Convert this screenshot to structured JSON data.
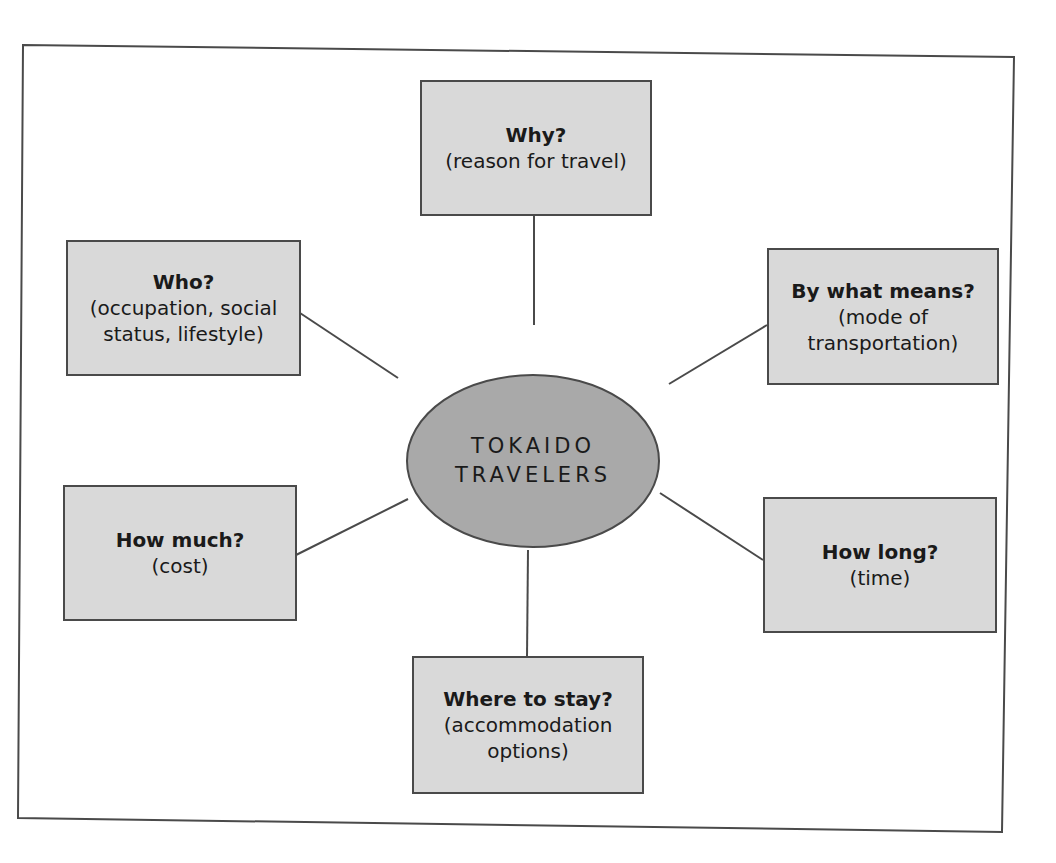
{
  "diagram": {
    "type": "mind-map",
    "center": {
      "line1": "TOKAIDO",
      "line2": "TRAVELERS"
    },
    "nodes": {
      "why": {
        "question": "Why?",
        "detail1": "(reason for travel)",
        "detail2": ""
      },
      "who": {
        "question": "Who?",
        "detail1": "(occupation, social",
        "detail2": "status, lifestyle)"
      },
      "means": {
        "question": "By what means?",
        "detail1": "(mode of",
        "detail2": "transportation)"
      },
      "how_much": {
        "question": "How much?",
        "detail1": "(cost)",
        "detail2": ""
      },
      "how_long": {
        "question": "How long?",
        "detail1": "(time)",
        "detail2": ""
      },
      "where": {
        "question": "Where to stay?",
        "detail1": "(accommodation",
        "detail2": "options)"
      }
    },
    "colors": {
      "box_fill": "#d9d9d9",
      "ellipse_fill": "#a9a9a9",
      "stroke": "#4a4a4a",
      "background": "#ffffff"
    }
  }
}
